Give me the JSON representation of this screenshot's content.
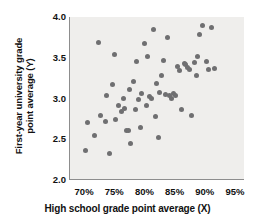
{
  "chart_data": {
    "type": "scatter",
    "title": "",
    "xlabel": "High school grade point average (X)",
    "ylabel_line1": "First-year university grade",
    "ylabel_line2": "point average (Y)",
    "ylabel": "First-year university grade point average (Y)",
    "xlim": [
      67.5,
      96.5
    ],
    "ylim": [
      2.0,
      4.0
    ],
    "xticks": [
      70,
      75,
      80,
      85,
      90,
      95
    ],
    "xticklabels": [
      "70%",
      "75%",
      "80%",
      "85%",
      "90%",
      "95%"
    ],
    "yticks": [
      2.0,
      2.5,
      3.0,
      3.5,
      4.0
    ],
    "yticklabels": [
      "2.0",
      "2.5",
      "3.0",
      "3.5",
      "4.0"
    ],
    "grid": false,
    "legend": null,
    "marker_color": "#6f6f71",
    "panel_color": "#efeeec",
    "axis_color": "#8d8d8d",
    "n_points": 60,
    "points": [
      {
        "x": 70.0,
        "y": 2.36
      },
      {
        "x": 70.4,
        "y": 2.7
      },
      {
        "x": 71.6,
        "y": 2.54
      },
      {
        "x": 72.3,
        "y": 3.69
      },
      {
        "x": 72.6,
        "y": 2.79
      },
      {
        "x": 73.4,
        "y": 2.72
      },
      {
        "x": 73.6,
        "y": 3.04
      },
      {
        "x": 74.1,
        "y": 2.32
      },
      {
        "x": 74.5,
        "y": 3.17
      },
      {
        "x": 74.8,
        "y": 3.54
      },
      {
        "x": 75.0,
        "y": 2.74
      },
      {
        "x": 75.6,
        "y": 2.91
      },
      {
        "x": 76.0,
        "y": 2.84
      },
      {
        "x": 76.3,
        "y": 3.0
      },
      {
        "x": 76.6,
        "y": 2.88
      },
      {
        "x": 76.9,
        "y": 2.61
      },
      {
        "x": 77.2,
        "y": 2.61
      },
      {
        "x": 77.4,
        "y": 3.11
      },
      {
        "x": 77.6,
        "y": 2.45
      },
      {
        "x": 78.0,
        "y": 3.21
      },
      {
        "x": 78.3,
        "y": 2.87
      },
      {
        "x": 78.6,
        "y": 3.45
      },
      {
        "x": 78.9,
        "y": 2.99
      },
      {
        "x": 79.2,
        "y": 2.64
      },
      {
        "x": 79.4,
        "y": 3.06
      },
      {
        "x": 79.8,
        "y": 3.67
      },
      {
        "x": 80.1,
        "y": 2.92
      },
      {
        "x": 80.3,
        "y": 3.51
      },
      {
        "x": 80.7,
        "y": 3.03
      },
      {
        "x": 81.0,
        "y": 3.0
      },
      {
        "x": 81.3,
        "y": 3.85
      },
      {
        "x": 81.6,
        "y": 2.78
      },
      {
        "x": 81.9,
        "y": 3.19
      },
      {
        "x": 82.1,
        "y": 2.52
      },
      {
        "x": 82.4,
        "y": 3.07
      },
      {
        "x": 82.7,
        "y": 3.28
      },
      {
        "x": 83.0,
        "y": 3.47
      },
      {
        "x": 83.3,
        "y": 3.05
      },
      {
        "x": 83.6,
        "y": 3.75
      },
      {
        "x": 84.0,
        "y": 3.04
      },
      {
        "x": 84.3,
        "y": 3.0
      },
      {
        "x": 84.7,
        "y": 3.06
      },
      {
        "x": 85.0,
        "y": 3.04
      },
      {
        "x": 85.3,
        "y": 3.39
      },
      {
        "x": 85.6,
        "y": 3.34
      },
      {
        "x": 85.9,
        "y": 2.86
      },
      {
        "x": 86.4,
        "y": 3.43
      },
      {
        "x": 86.6,
        "y": 3.42
      },
      {
        "x": 87.0,
        "y": 3.38
      },
      {
        "x": 87.3,
        "y": 3.35
      },
      {
        "x": 87.7,
        "y": 2.79
      },
      {
        "x": 88.1,
        "y": 3.44
      },
      {
        "x": 88.4,
        "y": 3.28
      },
      {
        "x": 88.7,
        "y": 3.51
      },
      {
        "x": 89.0,
        "y": 3.79
      },
      {
        "x": 89.4,
        "y": 3.89
      },
      {
        "x": 90.1,
        "y": 3.46
      },
      {
        "x": 90.5,
        "y": 3.36
      },
      {
        "x": 91.0,
        "y": 3.87
      },
      {
        "x": 91.4,
        "y": 3.37
      }
    ]
  }
}
